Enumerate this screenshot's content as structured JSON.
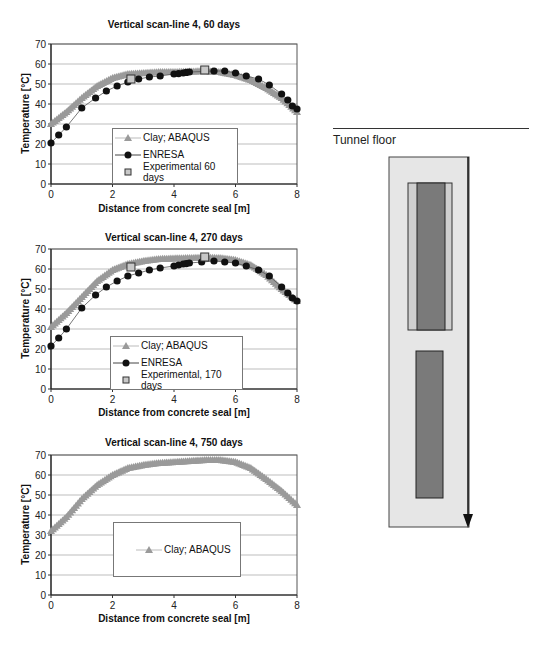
{
  "colors": {
    "abaqus": "#9a9a9a",
    "enresa": "#111111",
    "experimental_fill": "#c8c8c8",
    "grid": "#bdbdbd",
    "diagram_outer": "#e6e6e6",
    "diagram_inner_light": "#cfcfcf",
    "diagram_dark": "#7a7a7a"
  },
  "diagram": {
    "label": "Tunnel floor"
  },
  "chart_data": [
    {
      "type": "line",
      "title": "Vertical scan-line 4, 60 days",
      "xlabel": "Distance from concrete seal [m]",
      "ylabel": "Temperature [°C]",
      "xlim": [
        0,
        8
      ],
      "ylim": [
        0,
        70
      ],
      "xticks": [
        0,
        2,
        4,
        6,
        8
      ],
      "yticks": [
        0,
        10,
        20,
        30,
        40,
        50,
        60,
        70
      ],
      "grid": "horizontal",
      "legend_position": "inside-center-bottom",
      "series": [
        {
          "name": "Clay; ABAQUS",
          "marker": "triangle",
          "x": [
            0,
            0.5,
            1,
            1.5,
            2,
            2.5,
            3,
            3.5,
            4,
            4.5,
            5,
            5.5,
            6,
            6.5,
            7,
            7.5,
            8
          ],
          "y": [
            30,
            36,
            43,
            49,
            53,
            55,
            55.5,
            56,
            56,
            56.2,
            56.5,
            56,
            54.5,
            52,
            48,
            43,
            36
          ]
        },
        {
          "name": "ENRESA",
          "marker": "circle",
          "x": [
            0,
            0.25,
            0.5,
            1,
            1.45,
            1.8,
            2.15,
            2.5,
            2.85,
            3.2,
            3.55,
            4,
            4.15,
            4.3,
            4.4,
            4.5,
            5.3,
            5.65,
            6,
            6.35,
            6.75,
            7.1,
            7.5,
            7.7,
            7.85,
            8
          ],
          "y": [
            20.5,
            24.5,
            28.5,
            38,
            43,
            46.5,
            49,
            51,
            52.5,
            53.5,
            54,
            55,
            55.2,
            55.5,
            55.8,
            56,
            56.5,
            56.5,
            55.5,
            54,
            52.5,
            49.5,
            45,
            42,
            39,
            37.5
          ]
        },
        {
          "name": "Experimental 60 days",
          "marker": "square",
          "x": [
            2.6,
            5.0
          ],
          "y": [
            52.5,
            57
          ]
        }
      ]
    },
    {
      "type": "line",
      "title": "Vertical scan-line 4, 270 days",
      "xlabel": "Distance from concrete seal [m]",
      "ylabel": "Temperature [°C]",
      "xlim": [
        0,
        8
      ],
      "ylim": [
        0,
        70
      ],
      "xticks": [
        0,
        2,
        4,
        6,
        8
      ],
      "yticks": [
        0,
        10,
        20,
        30,
        40,
        50,
        60,
        70
      ],
      "grid": "horizontal",
      "legend_position": "inside-center-bottom",
      "series": [
        {
          "name": "Clay; ABAQUS",
          "marker": "triangle",
          "x": [
            0,
            0.5,
            1,
            1.5,
            2,
            2.5,
            3,
            3.5,
            4,
            4.5,
            5,
            5.5,
            6,
            6.5,
            7,
            7.5,
            8
          ],
          "y": [
            31,
            38,
            46,
            54,
            59.5,
            62.5,
            64,
            65,
            65.3,
            65.5,
            65.7,
            65.5,
            64.5,
            62,
            57,
            50,
            44
          ]
        },
        {
          "name": "ENRESA",
          "marker": "circle",
          "x": [
            0,
            0.25,
            0.5,
            1,
            1.45,
            1.8,
            2.15,
            2.5,
            2.85,
            3.2,
            3.55,
            4,
            4.15,
            4.3,
            4.4,
            4.5,
            4.9,
            5.3,
            5.65,
            6,
            6.35,
            6.75,
            7.1,
            7.5,
            7.7,
            7.85,
            8
          ],
          "y": [
            21.5,
            25.5,
            30,
            40.5,
            47,
            51,
            54,
            56.5,
            58,
            59.5,
            60.5,
            61.5,
            62,
            62.5,
            62.7,
            63,
            63.5,
            64,
            63.5,
            63,
            61.5,
            59.5,
            56.5,
            51,
            48,
            45.5,
            44
          ]
        },
        {
          "name": "Experimental, 170 days",
          "marker": "square",
          "x": [
            2.6,
            5.0
          ],
          "y": [
            61,
            66
          ]
        }
      ]
    },
    {
      "type": "line",
      "title": "Vertical scan-line 4, 750 days",
      "xlabel": "Distance from concrete seal [m]",
      "ylabel": "Temperature [°C]",
      "xlim": [
        0,
        8
      ],
      "ylim": [
        0,
        70
      ],
      "xticks": [
        0,
        2,
        4,
        6,
        8
      ],
      "yticks": [
        0,
        10,
        20,
        30,
        40,
        50,
        60,
        70
      ],
      "grid": "horizontal",
      "legend_position": "inside-center-bottom",
      "series": [
        {
          "name": "Clay; ABAQUS",
          "marker": "triangle",
          "x": [
            0,
            0.5,
            1,
            1.5,
            2,
            2.5,
            3,
            3.5,
            4,
            4.5,
            5,
            5.5,
            6,
            6.5,
            7,
            7.5,
            8
          ],
          "y": [
            32,
            39,
            48,
            55,
            60,
            63.5,
            65,
            66,
            66.5,
            67,
            67.5,
            67.5,
            66.5,
            63.5,
            58,
            52,
            45
          ]
        }
      ]
    }
  ]
}
